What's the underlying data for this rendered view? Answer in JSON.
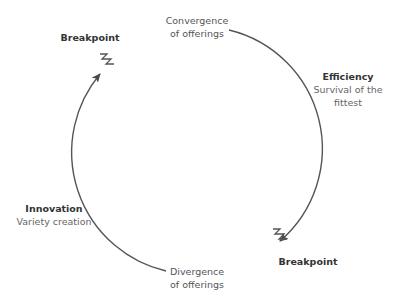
{
  "diagram": {
    "title": "",
    "nodes": {
      "top": {
        "line1": "Convergence",
        "line2": "of offerings"
      },
      "bottom": {
        "line1": "Divergence",
        "line2": "of offerings"
      },
      "efficiency": {
        "heading": "Efficiency",
        "line1": "Survival of the",
        "line2": "fittest"
      },
      "innovation": {
        "heading": "Innovation",
        "line1": "Variety creation"
      },
      "breakpoint_top_left": {
        "label": "Breakpoint"
      },
      "breakpoint_bottom_right": {
        "label": "Breakpoint"
      }
    },
    "colors": {
      "line": "#555555",
      "text": "#555555",
      "heading": "#333333"
    }
  }
}
